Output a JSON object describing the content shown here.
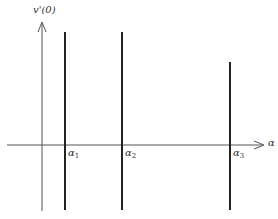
{
  "diagram": {
    "y_axis_label": "v'(0)",
    "x_axis_label": "α",
    "markers": [
      {
        "symbol": "α",
        "subscript": "1",
        "x": 65,
        "top": 32
      },
      {
        "symbol": "α",
        "subscript": "2",
        "x": 122,
        "top": 32
      },
      {
        "symbol": "α",
        "subscript": "3",
        "x": 230,
        "top": 62
      }
    ],
    "colors": {
      "axis": "#555555",
      "line": "#222222",
      "background": "#ffffff"
    }
  }
}
